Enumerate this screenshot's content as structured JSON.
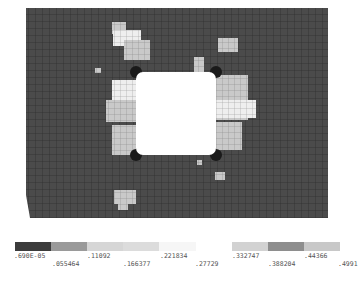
{
  "figure": {
    "plate_color": "#4a4a4a",
    "mesh_line_color": "#2e2e2e",
    "hole_color": "#ffffff",
    "corner_marker": "x"
  },
  "legend": {
    "segment_colors": [
      "#3c3c3c",
      "#9a9a9a",
      "#d6d6d6",
      "#dcdcdc",
      "#f6f6f6",
      "#ffffff",
      "#d2d2d2",
      "#8e8e8e",
      "#c8c8c8"
    ],
    "labels_top": [
      ".690E-05",
      ".11092",
      ".221834",
      ".332747",
      ".44366"
    ],
    "labels_bottom": [
      ".055464",
      ".166377",
      ".27729",
      ".388204",
      ".4991"
    ]
  }
}
